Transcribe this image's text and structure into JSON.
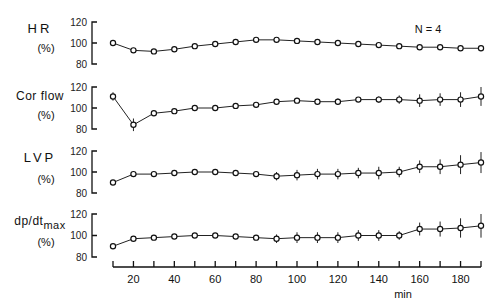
{
  "annotation": "N = 4",
  "x_axis": {
    "label": "min",
    "ticks": [
      10,
      20,
      30,
      40,
      50,
      60,
      70,
      80,
      90,
      100,
      110,
      120,
      130,
      140,
      150,
      160,
      170,
      180,
      190
    ],
    "tick_labels": [
      "20",
      "40",
      "60",
      "80",
      "100",
      "120",
      "140",
      "160",
      "180"
    ]
  },
  "panels": [
    {
      "label": "HR",
      "sublabel": null,
      "unit": "(%)",
      "ticks": [
        "120",
        "100",
        "80"
      ]
    },
    {
      "label": "Cor flow",
      "sublabel": null,
      "unit": "(%)",
      "ticks": [
        "120",
        "100",
        "80"
      ]
    },
    {
      "label": "LVP",
      "sublabel": null,
      "unit": "(%)",
      "ticks": [
        "120",
        "100",
        "80"
      ]
    },
    {
      "label": "dp/dt",
      "sublabel": "max",
      "unit": "(%)",
      "ticks": [
        "120",
        "100",
        "80"
      ]
    }
  ],
  "chart_data": {
    "type": "line",
    "title": "",
    "xlabel": "min",
    "ylabel": "%",
    "annotation": "N = 4",
    "x": [
      10,
      20,
      30,
      40,
      50,
      60,
      70,
      80,
      90,
      100,
      110,
      120,
      130,
      140,
      150,
      160,
      170,
      180,
      190
    ],
    "ylim": [
      80,
      120
    ],
    "grid": false,
    "legend": null,
    "series": [
      {
        "name": "HR (%)",
        "values": [
          100,
          93,
          92,
          94,
          97,
          99,
          101,
          103,
          103,
          102,
          101,
          100,
          99,
          98,
          97,
          96,
          96,
          95,
          95
        ],
        "error": [
          2,
          2,
          1,
          1,
          1,
          1,
          1,
          1,
          1,
          1,
          1,
          1,
          1,
          1,
          1,
          1,
          1,
          1,
          2
        ]
      },
      {
        "name": "Cor flow (%)",
        "values": [
          111,
          84,
          95,
          97,
          100,
          100,
          102,
          103,
          106,
          107,
          106,
          106,
          108,
          108,
          108,
          107,
          108,
          108,
          111
        ],
        "error": [
          4,
          6,
          1,
          1,
          1,
          1,
          1,
          1,
          1,
          1,
          1,
          3,
          2,
          3,
          4,
          6,
          6,
          7,
          9
        ]
      },
      {
        "name": "LVP (%)",
        "values": [
          90,
          98,
          98,
          99,
          100,
          100,
          99,
          98,
          96,
          97,
          98,
          98,
          99,
          99,
          100,
          105,
          105,
          107,
          109
        ],
        "error": [
          1,
          1,
          1,
          1,
          1,
          1,
          1,
          2,
          4,
          5,
          5,
          5,
          5,
          6,
          5,
          6,
          7,
          9,
          10
        ]
      },
      {
        "name": "dp/dtmax (%)",
        "values": [
          90,
          97,
          98,
          99,
          100,
          100,
          99,
          98,
          97,
          98,
          98,
          98,
          100,
          100,
          100,
          106,
          106,
          107,
          109
        ],
        "error": [
          1,
          2,
          1,
          1,
          1,
          1,
          1,
          2,
          4,
          5,
          5,
          5,
          5,
          5,
          4,
          6,
          7,
          9,
          11
        ]
      }
    ]
  }
}
